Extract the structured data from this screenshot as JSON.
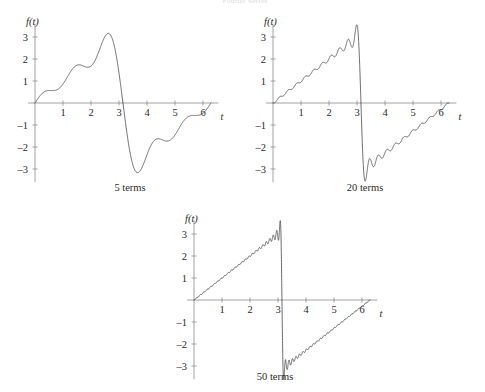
{
  "header": {
    "text": "Fourier Series"
  },
  "figure": {
    "title": "Fourier Series",
    "width": 485,
    "height": 392
  },
  "panels": [
    {
      "id": "panel-5-terms",
      "caption": "5 terms",
      "terms": 5,
      "left": 8,
      "top": 14,
      "caption_left": 70,
      "caption_top": 182,
      "caption_width": 120
    },
    {
      "id": "panel-20-terms",
      "caption": "20 terms",
      "terms": 20,
      "left": 246,
      "top": 14,
      "caption_left": 305,
      "caption_top": 182,
      "caption_width": 120
    },
    {
      "id": "panel-50-terms",
      "caption": "50 terms",
      "terms": 50,
      "left": 167,
      "top": 211,
      "caption_left": 215,
      "caption_top": 371,
      "caption_width": 120
    }
  ],
  "chart_data": [
    {
      "type": "line",
      "id": "fourier-5-terms",
      "title": "5 terms",
      "xlabel": "t",
      "ylabel": "f(t)",
      "xlim": [
        -0.25,
        6.55
      ],
      "ylim": [
        -3.6,
        3.6
      ],
      "xticks": [
        1,
        2,
        3,
        4,
        5,
        6
      ],
      "yticks": [
        -3,
        -2,
        -1,
        1,
        2,
        3
      ],
      "xtick_labels": [
        "1",
        "2",
        "3",
        "4",
        "5",
        "6"
      ],
      "ytick_labels": [
        "-3",
        "-2",
        "-1",
        "1",
        "2",
        "3"
      ],
      "grid": false,
      "legend": null,
      "series": [
        {
          "name": "partial sum N=5",
          "function": "sawtooth_fourier",
          "formula": "f(t) = 2 * sum_{n=1..N} ((-1)^(n+1)/n) * sin(n*t)",
          "n_terms": 5,
          "amplitude": 2,
          "period": 6.283185307179586,
          "samples": 1400
        }
      ],
      "annotations": [
        "local max approx 3.1 near t = 2.6",
        "local min approx -3.1 near t = 3.7",
        "zero crossing at t = pi"
      ]
    },
    {
      "type": "line",
      "id": "fourier-20-terms",
      "title": "20 terms",
      "xlabel": "t",
      "ylabel": "f(t)",
      "xlim": [
        -0.25,
        6.55
      ],
      "ylim": [
        -3.6,
        3.6
      ],
      "xticks": [
        1,
        2,
        3,
        4,
        5,
        6
      ],
      "yticks": [
        -3,
        -2,
        -1,
        1,
        2,
        3
      ],
      "xtick_labels": [
        "1",
        "2",
        "3",
        "4",
        "5",
        "6"
      ],
      "ytick_labels": [
        "-3",
        "-2",
        "-1",
        "1",
        "2",
        "3"
      ],
      "grid": false,
      "legend": null,
      "series": [
        {
          "name": "partial sum N=20",
          "function": "sawtooth_fourier",
          "formula": "f(t) = 2 * sum_{n=1..N} ((-1)^(n+1)/n) * sin(n*t)",
          "n_terms": 20,
          "amplitude": 2,
          "period": 6.283185307179586,
          "samples": 2600
        }
      ],
      "annotations": [
        "Gibbs overshoot approx 3.5 just left of t = pi",
        "Gibbs undershoot approx -3.5 just right of t = pi",
        "ringing ripples visible between t = 2.3 and t = 4.2"
      ]
    },
    {
      "type": "line",
      "id": "fourier-50-terms",
      "title": "50 terms",
      "xlabel": "t",
      "ylabel": "f(t)",
      "xlim": [
        -0.25,
        6.55
      ],
      "ylim": [
        -3.6,
        3.6
      ],
      "xticks": [
        1,
        2,
        3,
        4,
        5,
        6
      ],
      "yticks": [
        -3,
        -2,
        -1,
        1,
        2,
        3
      ],
      "xtick_labels": [
        "1",
        "2",
        "3",
        "4",
        "5",
        "6"
      ],
      "ytick_labels": [
        "-3",
        "-2",
        "-1",
        "1",
        "2",
        "3"
      ],
      "grid": false,
      "legend": null,
      "series": [
        {
          "name": "partial sum N=50",
          "function": "sawtooth_fourier",
          "formula": "f(t) = 2 * sum_{n=1..N} ((-1)^(n+1)/n) * sin(n*t)",
          "n_terms": 50,
          "amplitude": 2,
          "period": 6.283185307179586,
          "samples": 4200
        }
      ],
      "annotations": [
        "near-vertical jump at t = pi",
        "tight Gibbs ripples hugging the ramp",
        "overshoot approx 3.5, undershoot approx -3.5"
      ]
    }
  ]
}
